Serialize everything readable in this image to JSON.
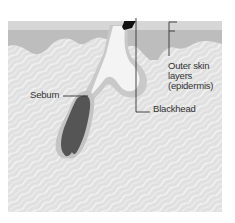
{
  "diagram": {
    "labels": {
      "outer_skin_line1": "Outer skin",
      "outer_skin_line2": "layers",
      "outer_skin_line3": "(epidermis)",
      "sebum": "Sebum",
      "blackhead": "Blackhead"
    },
    "colors": {
      "background": "#ffffff",
      "surface_band": "#d8d8d8",
      "epidermis": "#bdbdbd",
      "dermis": "#e2e2e2",
      "dermis_streaks": "#f4f4f4",
      "pore_channel": "#f6f6f6",
      "follicle_wall": "#c9c9c9",
      "sebum_gland": "#555555",
      "blackhead_plug": "#111111",
      "leader_line": "#333333"
    }
  }
}
